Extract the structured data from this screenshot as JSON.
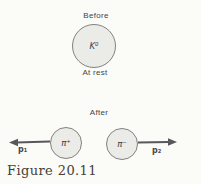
{
  "figure": {
    "caption": "Figure 20.11",
    "before_label": "Before",
    "after_label": "After",
    "at_rest_label": "At rest"
  },
  "particles": {
    "kaon": "K⁰",
    "pi_plus": "π⁺",
    "pi_minus": "π⁻"
  },
  "momenta": {
    "p1": "p₁",
    "p2": "p₂"
  },
  "colors": {
    "background": "#fbfbf8",
    "circle_fill": "#ebebe8",
    "circle_border": "#83827f",
    "arrow": "#58585a",
    "label_text": "#444446",
    "caption_text": "#474038"
  }
}
